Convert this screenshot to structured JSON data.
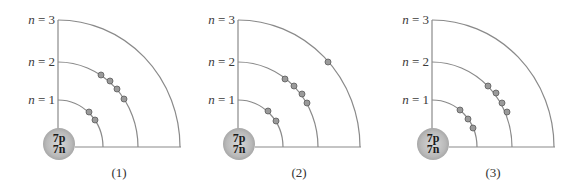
{
  "figure": {
    "level_labels": [
      {
        "var": "n",
        "text": " = 3"
      },
      {
        "var": "n",
        "text": " = 2"
      },
      {
        "var": "n",
        "text": " = 1"
      }
    ],
    "nucleus": {
      "protons": "7p",
      "neutrons": "7n"
    },
    "colors": {
      "shell_line": "#8a8a8a",
      "electron_fill": "#9a9a9a",
      "electron_stroke": "#5a5a5a"
    },
    "panels": [
      {
        "caption": "(1)",
        "electrons": {
          "n1": 2,
          "n2": 4,
          "n3": 0
        }
      },
      {
        "caption": "(2)",
        "electrons": {
          "n1": 2,
          "n2": 4,
          "n3": 1
        }
      },
      {
        "caption": "(3)",
        "electrons": {
          "n1": 3,
          "n2": 4,
          "n3": 0
        }
      }
    ]
  }
}
